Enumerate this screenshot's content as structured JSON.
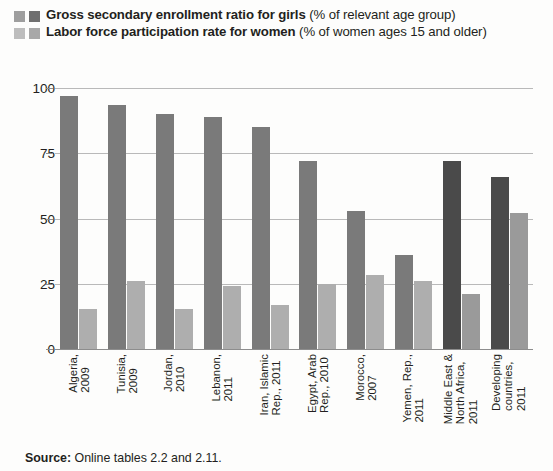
{
  "legend": {
    "items": [
      {
        "bold_text": "Gross secondary enrollment ratio for girls",
        "normal_text": " (% of relevant age group)",
        "swatch_light": "#9e9e9e",
        "swatch_dark": "#6f6f6f",
        "series_key": "enrollment"
      },
      {
        "bold_text": "Labor force participation rate for women",
        "normal_text": " (% of women ages 15 and older)",
        "swatch_light": "#bdbdbd",
        "swatch_dark": "#a8a8a8",
        "series_key": "labor"
      }
    ]
  },
  "source": {
    "label": "Source:",
    "text": " Online tables 2.2 and 2.11."
  },
  "colors": {
    "bar_enrollment": "#7a7a7a",
    "bar_labor": "#aeaeae",
    "bar_enrollment_highlight": "#4a4a4a",
    "bar_labor_highlight": "#9a9a9a",
    "gridline": "#b9b9b9",
    "axis": "#8d8d8d",
    "text": "#231f20",
    "background": "#fdfdfc"
  },
  "chart_data": {
    "type": "bar",
    "title": "",
    "xlabel": "",
    "ylabel": "",
    "ylim": [
      0,
      100
    ],
    "yticks": [
      0,
      25,
      50,
      75,
      100
    ],
    "ytick_labels": [
      "0",
      "25",
      "50",
      "75",
      "100"
    ],
    "grid": true,
    "legend_position": "top",
    "orientation": "vertical",
    "grouped": true,
    "categories": [
      "Algeria, 2009",
      "Tunisia, 2009",
      "Jordan, 2010",
      "Lebanon, 2011",
      "Iran, Islamic Rep., 2011",
      "Egypt, Arab Rep., 2010",
      "Morocco, 2007",
      "Yemen, Rep., 2011",
      "Middle East & North Africa, 2011",
      "Developing countries, 2011"
    ],
    "category_lines": [
      [
        "Algeria,",
        "2009"
      ],
      [
        "Tunisia,",
        "2009"
      ],
      [
        "Jordan,",
        "2010"
      ],
      [
        "Lebanon,",
        "2011"
      ],
      [
        "Iran, Islamic",
        "Rep., 2011"
      ],
      [
        "Egypt, Arab",
        "Rep., 2010"
      ],
      [
        "Morocco,",
        "2007"
      ],
      [
        "Yemen, Rep.,",
        "2011"
      ],
      [
        "Middle East &",
        "North Africa,",
        "2011"
      ],
      [
        "Developing",
        "countries,",
        "2011"
      ]
    ],
    "highlighted": [
      false,
      false,
      false,
      false,
      false,
      false,
      false,
      false,
      true,
      true
    ],
    "series": [
      {
        "name": "Gross secondary enrollment ratio for girls (% of relevant age group)",
        "key": "enrollment",
        "values": [
          97,
          93.5,
          90,
          89,
          85,
          72,
          53,
          36,
          72,
          66
        ]
      },
      {
        "name": "Labor force participation rate for women (% of women ages 15 and older)",
        "key": "labor",
        "values": [
          15.5,
          26,
          15.5,
          24,
          17,
          25,
          28.5,
          26,
          21,
          52
        ]
      }
    ]
  }
}
